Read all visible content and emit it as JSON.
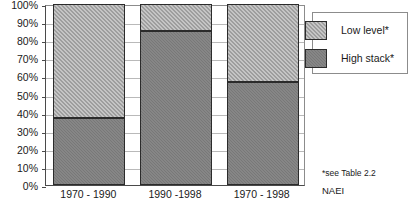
{
  "chart_data": {
    "type": "bar",
    "subtype": "stacked-100-percent",
    "title": "",
    "xlabel": "",
    "ylabel": "",
    "ylim": [
      0,
      100
    ],
    "y_tick_labels": [
      "100%",
      "90%",
      "80%",
      "70%",
      "60%",
      "50%",
      "40%",
      "30%",
      "20%",
      "10%",
      "0%"
    ],
    "y_tick_values": [
      100,
      90,
      80,
      70,
      60,
      50,
      40,
      30,
      20,
      10,
      0
    ],
    "grid": true,
    "grid_axis": "y",
    "legend_position": "right-top",
    "categories": [
      "1970 - 1990",
      "1990 -1998",
      "1970 - 1998"
    ],
    "series": [
      {
        "name": "Low level*",
        "values": [
          63,
          15,
          43
        ],
        "color": "#9e9e9e",
        "pattern": "checkered-light"
      },
      {
        "name": "High stack*",
        "values": [
          37,
          85,
          57
        ],
        "color": "#787878",
        "pattern": "solid-gray"
      }
    ],
    "stack_order_top_to_bottom": [
      "Low level*",
      "High stack*"
    ],
    "annotations": [
      "*see Table 2.2",
      "NAEI"
    ]
  },
  "legend": {
    "items": [
      {
        "label": "Low level*",
        "swatch_class": "seg-low"
      },
      {
        "label": "High stack*",
        "swatch_class": "seg-high"
      }
    ]
  },
  "footnotes": {
    "table_note": "*see Table 2.2",
    "source": "NAEI"
  },
  "colors": {
    "low_level": "#9e9e9e",
    "high_stack": "#787878",
    "axis": "#4a4a4a",
    "gridline": "#b9b9b9",
    "bar_outline": "#2b2b2b",
    "text": "#1a1a1a",
    "background": "#ffffff"
  }
}
